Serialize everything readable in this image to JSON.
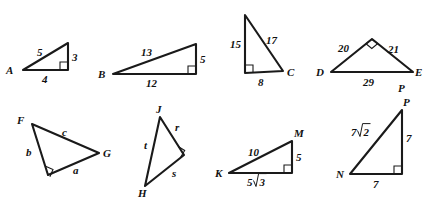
{
  "figure": {
    "stroke_color": "#1a1a1a",
    "text_color": "#111111",
    "background": "#ffffff"
  },
  "triangles": [
    {
      "id": "triangle-A",
      "vertices": [
        "A"
      ],
      "vertex_labels": {
        "A": "A"
      },
      "side_labels": {
        "hypotenuse": "5",
        "vertical": "3",
        "base": "4"
      },
      "right_angle": "bottom-right"
    },
    {
      "id": "triangle-B",
      "vertices": [
        "B"
      ],
      "vertex_labels": {
        "B": "B"
      },
      "side_labels": {
        "hypotenuse": "13",
        "vertical": "5",
        "base": "12"
      },
      "right_angle": "bottom-right"
    },
    {
      "id": "triangle-C",
      "vertices": [
        "C"
      ],
      "vertex_labels": {
        "C": "C"
      },
      "side_labels": {
        "vertical": "15",
        "hypotenuse": "17",
        "base": "8"
      },
      "right_angle": "bottom-left"
    },
    {
      "id": "triangle-DE",
      "vertices": [
        "D",
        "E"
      ],
      "vertex_labels": {
        "D": "D",
        "E": "E",
        "extra": "P"
      },
      "side_labels": {
        "left": "20",
        "right": "21",
        "base": "29"
      },
      "right_angle": "apex"
    },
    {
      "id": "triangle-FG",
      "vertices": [
        "F",
        "G"
      ],
      "vertex_labels": {
        "F": "F",
        "G": "G"
      },
      "side_labels": {
        "top": "c",
        "left": "b",
        "bottom": "a"
      },
      "right_angle": "bottom-left"
    },
    {
      "id": "triangle-JH",
      "vertices": [
        "J",
        "H"
      ],
      "vertex_labels": {
        "J": "J",
        "H": "H"
      },
      "side_labels": {
        "upper_right": "r",
        "left": "t",
        "lower_right": "s"
      },
      "right_angle": "right"
    },
    {
      "id": "triangle-KM",
      "vertices": [
        "K",
        "M"
      ],
      "vertex_labels": {
        "K": "K",
        "M": "M"
      },
      "side_labels": {
        "hypotenuse": "10",
        "vertical": "5",
        "base": "5√3"
      },
      "base_radicand": "3",
      "base_coefficient": "5",
      "right_angle": "bottom-right"
    },
    {
      "id": "triangle-NP",
      "vertices": [
        "N",
        "P"
      ],
      "vertex_labels": {
        "N": "N",
        "P": "P"
      },
      "side_labels": {
        "hypotenuse": "7√2",
        "vertical": "7",
        "base": "7"
      },
      "hyp_radicand": "2",
      "hyp_coefficient": "7",
      "right_angle": "bottom-right"
    }
  ]
}
